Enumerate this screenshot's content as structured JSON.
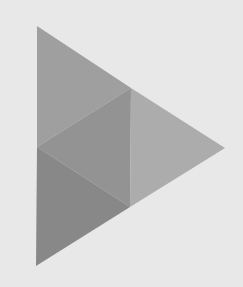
{
  "background": "#e8e8e8",
  "icon": {
    "name": "play-triangle-icon",
    "facets": [
      {
        "id": "top-left",
        "points": "37,26 131,88 37,147",
        "color": "#9f9f9f"
      },
      {
        "id": "center",
        "points": "37,147 131,88 130,207",
        "color": "#939393"
      },
      {
        "id": "right",
        "points": "131,88 225,148 130,207",
        "color": "#acacac"
      },
      {
        "id": "bottom-left",
        "points": "37,147 130,207 36,266",
        "color": "#888888"
      }
    ]
  }
}
